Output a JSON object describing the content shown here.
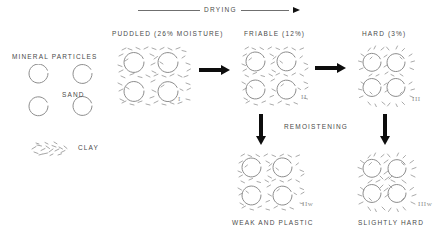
{
  "figure": {
    "title_arrow": {
      "label": "DRYING",
      "direction": "right"
    },
    "legend": {
      "mineral_particles_label": "MINERAL PARTICLES",
      "sand_label": "SAND",
      "clay_label": "CLAY",
      "sand_circle_count": 4,
      "clay_symbol": "clay-flecks"
    },
    "columns": [
      {
        "id": "puddled",
        "header": "PUDDLED (26% MOISTURE)",
        "numeral": "I",
        "moisture_percent": 26,
        "state": "puddled",
        "packing": "dispersed",
        "caption": ""
      },
      {
        "id": "friable",
        "header": "FRIABLE (12%)",
        "numeral": "II",
        "moisture_percent": 12,
        "state": "friable",
        "packing": "medium",
        "caption": ""
      },
      {
        "id": "hard",
        "header": "HARD (3%)",
        "numeral": "III",
        "moisture_percent": 3,
        "state": "hard",
        "packing": "tight",
        "caption": ""
      }
    ],
    "remoistening": {
      "label": "REMOISTENING",
      "direction": "down"
    },
    "remoistened": [
      {
        "id": "friable-remoistened",
        "numeral": "IIw",
        "caption": "WEAK AND PLASTIC",
        "packing": "medium"
      },
      {
        "id": "hard-remoistened",
        "numeral": "IIIw",
        "caption": "SLIGHTLY HARD",
        "packing": "tight"
      }
    ],
    "colors": {
      "ink": "#4a4a4a",
      "arrow": "#0d0d0d",
      "sketch": "#9a9a9a",
      "background": "#ffffff"
    }
  }
}
